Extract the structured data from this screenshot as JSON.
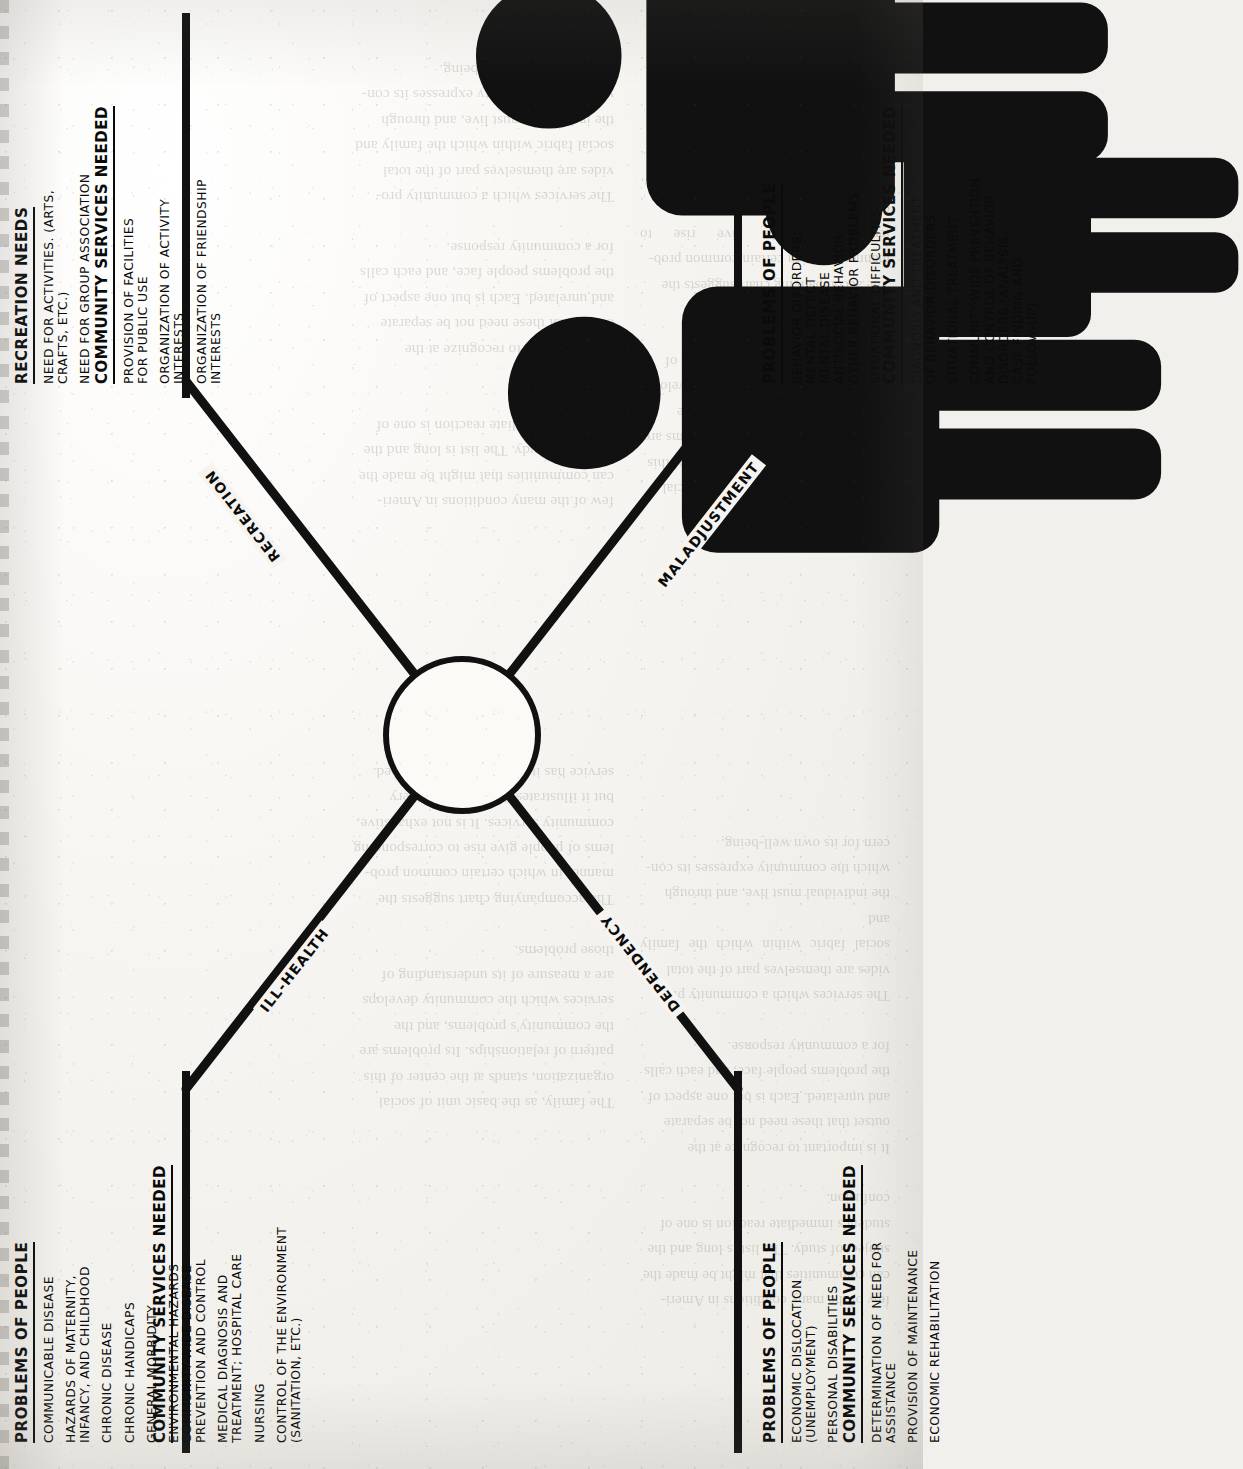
{
  "document": {
    "type": "scanned-book-page",
    "orientation": "landscape-diagram-rotated-90-ccw",
    "figure_title": "",
    "background_color": "#f2f0ec",
    "ink_color": "#0b0b0b"
  },
  "diagram": {
    "hub": {
      "icon_name": "family-group-silhouette",
      "label": "",
      "figure_count": 4
    },
    "spokes": [
      {
        "key": "ill_health",
        "label": "ILL-HEALTH",
        "position": "upper-left"
      },
      {
        "key": "recreation",
        "label": "RECREATION",
        "position": "upper-right"
      },
      {
        "key": "dependency",
        "label": "DEPENDENCY",
        "position": "lower-left"
      },
      {
        "key": "maladjustment",
        "label": "MALADJUSTMENT",
        "position": "lower-right"
      }
    ],
    "quadrants": [
      {
        "key": "ill_health",
        "position": "top-left",
        "problems": {
          "heading": "PROBLEMS OF PEOPLE",
          "items": [
            "COMMUNICABLE DISEASE",
            "HAZARDS OF MATERNITY,\n  INFANCY, AND CHILDHOOD",
            "CHRONIC DISEASE",
            "CHRONIC HANDICAPS",
            "GENERAL MORBIDITY",
            "ENVIRONMENTAL HAZARDS"
          ]
        },
        "services": {
          "heading": "COMMUNITY SERVICES NEEDED",
          "items": [
            "COMMUNITY-WIDE DISEASE\n  PREVENTION AND CONTROL",
            "MEDICAL DIAGNOSIS AND\n  TREATMENT; HOSPITAL CARE",
            "NURSING",
            "CONTROL OF THE ENVIRONMENT\n  (SANITATION, ETC.)"
          ]
        }
      },
      {
        "key": "recreation",
        "position": "top-right",
        "problems": {
          "heading": "RECREATION NEEDS",
          "items": [
            "NEED FOR ACTIVITIES. (ARTS,\n  CRAFTS, ETC.)",
            "NEED FOR GROUP ASSOCIATION"
          ]
        },
        "services": {
          "heading": "COMMUNITY SERVICES NEEDED",
          "items": [
            "PROVISION OF FACILITIES\n  FOR PUBLIC USE",
            "ORGANIZATION OF ACTIVITY\n  INTERESTS",
            "ORGANIZATION OF FRIENDSHIP\n  INTERESTS"
          ]
        }
      },
      {
        "key": "dependency",
        "position": "bottom-left",
        "problems": {
          "heading": "PROBLEMS OF PEOPLE",
          "items": [
            "ECONOMIC DISLOCATION\n  (UNEMPLOYMENT)",
            "PERSONAL DISABILITIES"
          ]
        },
        "services": {
          "heading": "COMMUNITY SERVICES NEEDED",
          "items": [
            "DETERMINATION OF NEED FOR\n  ASSISTANCE",
            "PROVISION OF MAINTENANCE",
            "ECONOMIC REHABILITATION"
          ]
        }
      },
      {
        "key": "maladjustment",
        "position": "bottom-right",
        "problems": {
          "heading": "PROBLEMS OF PEOPLE",
          "items_tight": [
            "BEHAVIOR DISORDERS:",
            "  MENTAL DEFECT",
            "  MENTAL DISEASE",
            "  ANTISOCIAL BEHAVIOR",
            "  OTHER BEHAVIOR PROBLEMS"
          ],
          "items": [
            "SITUATIONAL DIFFICULTIES"
          ]
        },
        "services": {
          "heading": "COMMUNITY SERVICES NEEDED",
          "items": [
            "DIAGNOSIS AND TREATMENT\n  OF BEHAVIOR DISORDERS",
            "SITUATIONAL TREATMENT",
            "COMMUNITY-WIDE PREVENTION\n  AND CONTROL OF BEHAVIOR\n  DISORDERS (ANALYSIS,\n  CASE FINDING AND\n  FOLLOW-UP)"
          ]
        }
      }
    ]
  },
  "bleed_through": {
    "note": "faint mirrored text from the reverse side of the page",
    "col_a": "few of the many conditions in Ameri-\ncan communities that might be made the\nsubject of study. The list is long and the\nstudent's immediate reaction is one of\nconfusion.\n\nIt is important to recognize at the\noutset that these need not be separate\nand unrelated. Each is but one aspect of\nthe problems people face, and each calls\nfor a community response.\n\nThe services which a community pro-\nvides are themselves part of the total\nsocial fabric within which the family and\nthe individual must live, and through\nwhich the community expresses its con-\ncern for its own well-being.",
    "col_b": "The family, as the basic unit of social\norganization, stands at the center of this\npattern of relationships. Its problems are\nthe community's problems, and the\nservices which the community develops\nare a measure of its understanding of\nthose problems.\n\nThe accompanying chart suggests the\nmanner in which certain common prob-\nlems of people give rise to corresponding\ncommunity services. It is not exhaustive,\nbut it illustrates the principle: every\nservice has its origin in a human need."
  }
}
